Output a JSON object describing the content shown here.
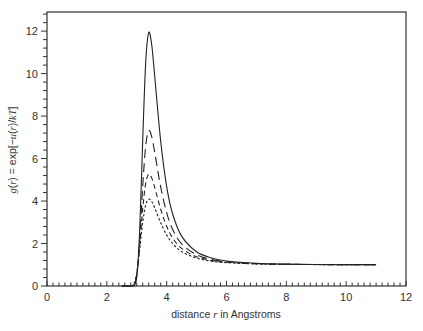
{
  "chart_data": {
    "type": "line",
    "title": "",
    "xlabel": "distance r in Angstroms",
    "xlabel_parts": [
      "distance ",
      "r",
      " in Angstroms"
    ],
    "ylabel": "g(r) = exp[-u(r)/kT]",
    "xlim": [
      0,
      12
    ],
    "ylim": [
      0,
      12.9
    ],
    "x_ticks": [
      0,
      2,
      4,
      6,
      8,
      10,
      12
    ],
    "x_tick_labels": [
      "0",
      "2",
      "4",
      "6",
      "8",
      "10",
      "12"
    ],
    "x_minor_step": 0.2,
    "y_ticks": [
      0,
      2,
      4,
      6,
      8,
      10,
      12
    ],
    "y_tick_labels": [
      "0",
      "2",
      "4",
      "6",
      "8",
      "10",
      "12"
    ],
    "y_minor_step": 0.4,
    "grid": false,
    "legend": null,
    "x": [
      2.5,
      2.6,
      2.7,
      2.8,
      2.9,
      3.0,
      3.1,
      3.2,
      3.3,
      3.4,
      3.5,
      3.6,
      3.8,
      4.0,
      4.2,
      4.5,
      5.0,
      5.5,
      6.0,
      7.0,
      8.0,
      9.0,
      10.0,
      11.0
    ],
    "series": [
      {
        "name": "solid",
        "style": "solid",
        "values": [
          0,
          0,
          0,
          0.0,
          0.014,
          0.41,
          2.67,
          6.9,
          10.55,
          11.93,
          11.36,
          9.89,
          6.82,
          4.68,
          3.39,
          2.35,
          1.61,
          1.32,
          1.18,
          1.068,
          1.03,
          1.015,
          1.008,
          1.004
        ]
      },
      {
        "name": "long-dash",
        "style": "long-dash",
        "values": [
          0,
          0,
          0,
          0.0002,
          0.032,
          0.49,
          2.2,
          4.71,
          6.62,
          7.31,
          7.03,
          6.29,
          4.67,
          3.45,
          2.66,
          1.98,
          1.47,
          1.25,
          1.14,
          1.054,
          1.024,
          1.012,
          1.006,
          1.004
        ]
      },
      {
        "name": "medium-dash",
        "style": "medium-dash",
        "values": [
          0,
          0,
          0,
          0.001,
          0.056,
          0.55,
          1.93,
          3.64,
          4.84,
          5.26,
          5.09,
          4.64,
          3.61,
          2.81,
          2.26,
          1.77,
          1.38,
          1.2,
          1.12,
          1.045,
          1.02,
          1.01,
          1.005,
          1.003
        ]
      },
      {
        "name": "dotted",
        "style": "short-dash",
        "values": [
          0,
          0,
          0,
          0.003,
          0.086,
          0.6,
          1.75,
          3.0,
          3.82,
          4.09,
          3.98,
          3.68,
          2.98,
          2.4,
          2.0,
          1.62,
          1.31,
          1.17,
          1.1,
          1.038,
          1.017,
          1.008,
          1.004,
          1.003
        ]
      }
    ],
    "colors": {
      "line": "#222222",
      "frame": "#333333",
      "text": "#333333",
      "background": "#ffffff"
    }
  }
}
